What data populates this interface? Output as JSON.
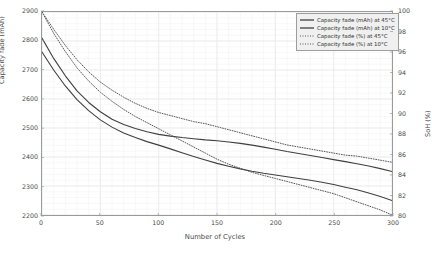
{
  "chart_data": {
    "type": "line",
    "title": "",
    "xlabel": "Number of Cycles",
    "ylabel": "Capacity fade (mAh)",
    "y2label": "SoH (%)",
    "xlim": [
      0,
      300
    ],
    "ylim": [
      2200,
      2900
    ],
    "y2lim": [
      80,
      100
    ],
    "xticks": [
      0,
      50,
      100,
      150,
      200,
      250,
      300
    ],
    "yticks": [
      2200,
      2300,
      2400,
      2500,
      2600,
      2700,
      2800,
      2900
    ],
    "y2ticks": [
      80,
      82,
      84,
      86,
      88,
      90,
      92,
      94,
      96,
      98,
      100
    ],
    "grid": true,
    "minor_grid": true,
    "legend_position": "top-right",
    "x": [
      0,
      10,
      20,
      30,
      40,
      50,
      60,
      70,
      80,
      90,
      100,
      110,
      120,
      130,
      140,
      150,
      160,
      170,
      180,
      190,
      200,
      210,
      220,
      230,
      240,
      250,
      260,
      270,
      280,
      290,
      300
    ],
    "series": [
      {
        "name": "Capacity fade (mAh) at 45°C",
        "axis": "left",
        "style": "solid",
        "color": "#3f3f3f",
        "values": [
          2810,
          2740,
          2680,
          2628,
          2588,
          2556,
          2530,
          2512,
          2498,
          2487,
          2478,
          2472,
          2467,
          2463,
          2459,
          2456,
          2452,
          2447,
          2441,
          2434,
          2427,
          2419,
          2412,
          2405,
          2398,
          2391,
          2384,
          2377,
          2369,
          2360,
          2350
        ]
      },
      {
        "name": "Capacity fade (mAh) at 10°C",
        "axis": "left",
        "style": "solid",
        "color": "#3f3f3f",
        "values": [
          2762,
          2700,
          2645,
          2598,
          2560,
          2528,
          2503,
          2483,
          2467,
          2453,
          2441,
          2428,
          2415,
          2402,
          2390,
          2378,
          2368,
          2359,
          2351,
          2344,
          2338,
          2332,
          2326,
          2320,
          2313,
          2305,
          2296,
          2287,
          2276,
          2264,
          2250
        ]
      },
      {
        "name": "Capacity fade (%) at 45°C",
        "axis": "right",
        "style": "dotted",
        "color": "#565656",
        "values": [
          100.0,
          98.3,
          96.7,
          95.3,
          94.1,
          93.1,
          92.3,
          91.6,
          91.0,
          90.5,
          90.1,
          89.8,
          89.5,
          89.2,
          89.0,
          88.7,
          88.4,
          88.1,
          87.8,
          87.5,
          87.2,
          86.9,
          86.7,
          86.5,
          86.3,
          86.1,
          85.9,
          85.8,
          85.6,
          85.4,
          85.2
        ]
      },
      {
        "name": "Capacity fade (%) at 10°C",
        "axis": "right",
        "style": "dotted",
        "color": "#565656",
        "values": [
          100.0,
          97.9,
          96.1,
          94.5,
          93.2,
          92.1,
          91.2,
          90.4,
          89.7,
          89.1,
          88.5,
          87.9,
          87.3,
          86.7,
          86.1,
          85.5,
          85.0,
          84.6,
          84.2,
          83.9,
          83.6,
          83.3,
          83.0,
          82.7,
          82.4,
          82.1,
          81.7,
          81.3,
          80.9,
          80.5,
          80.0
        ]
      }
    ]
  },
  "legend": {
    "items": [
      {
        "label": "Capacity fade (mAh) at 45°C",
        "style": "solid"
      },
      {
        "label": "Capacity fade (mAh) at 10°C",
        "style": "solid"
      },
      {
        "label": "Capacity fade (%) at 45°C",
        "style": "dotted"
      },
      {
        "label": "Capacity fade (%) at 10°C",
        "style": "dotted"
      }
    ]
  },
  "colors": {
    "solid_line": "#3f3f3f",
    "dotted_line": "#565656",
    "grid": "#e9e9e9",
    "minor_grid": "#f3f3f3",
    "axis": "#9a9a9a",
    "text": "#4a4a4a",
    "legend_bg": "#f0f0f0"
  }
}
